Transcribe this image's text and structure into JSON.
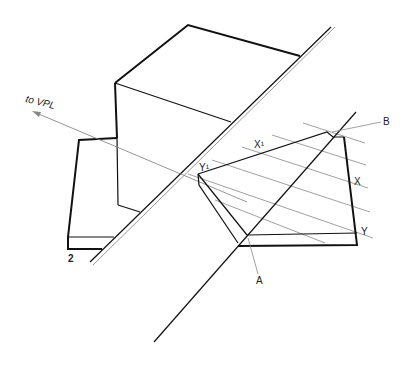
{
  "diagram": {
    "title": "",
    "figure_number": "2",
    "labels": {
      "vpl": "to VPL",
      "A": "A",
      "B": "B",
      "X": "X",
      "X1": "X¹",
      "Y": "Y",
      "Y1": "Y¹"
    },
    "colors": {
      "line": "#111111",
      "construction": "#888888",
      "background": "#ffffff"
    }
  }
}
